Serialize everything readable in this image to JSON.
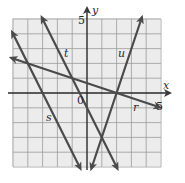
{
  "chart_data": {
    "type": "line",
    "title": "",
    "xlabel": "x",
    "ylabel": "y",
    "xlim": [
      -5,
      5
    ],
    "ylim": [
      -5,
      5
    ],
    "grid": true,
    "tick_labels": {
      "x_max": "5",
      "y_max": "5",
      "origin": "0"
    },
    "series": [
      {
        "name": "r",
        "equation": "y = -x/3 + 2/3",
        "x": [
          -5,
          4.8
        ],
        "y": [
          2.33,
          -0.93
        ]
      },
      {
        "name": "s",
        "equation": "y = -2x - 6",
        "x": [
          -5,
          -0.5
        ],
        "y": [
          4,
          -5
        ]
      },
      {
        "name": "t",
        "equation": "y = -2x - 1",
        "x": [
          -3,
          2
        ],
        "y": [
          5,
          -5
        ]
      },
      {
        "name": "u",
        "equation": "y = 3x - 6",
        "x": [
          0.33,
          3.67
        ],
        "y": [
          -5,
          5
        ]
      }
    ],
    "annotations": [
      {
        "text": "r",
        "x": 3.3,
        "y": -1.2
      },
      {
        "text": "s",
        "x": -4.2,
        "y": -1.6
      },
      {
        "text": "t",
        "x": -2.1,
        "y": 2.8
      },
      {
        "text": "u",
        "x": 2.2,
        "y": 2.8
      }
    ]
  },
  "labels": {
    "x_axis": "x",
    "y_axis": "y",
    "x_tick": "5",
    "y_tick": "5",
    "origin": "0",
    "line_r": "r",
    "line_s": "s",
    "line_t": "t",
    "line_u": "u"
  }
}
